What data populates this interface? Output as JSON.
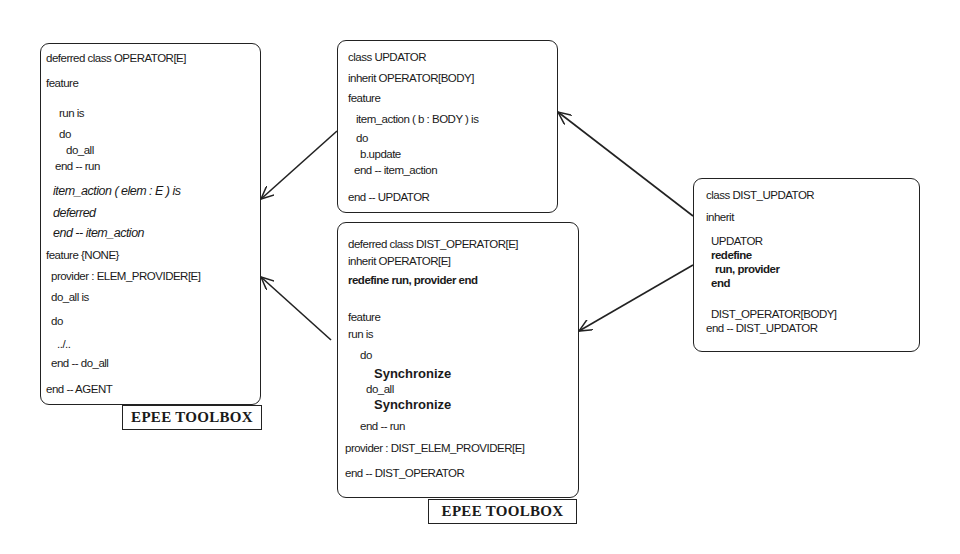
{
  "diagram": {
    "boxes": {
      "operator": {
        "lines": [
          "deferred class OPERATOR[E]",
          "feature",
          "run is",
          "do",
          "do_all",
          "end -- run",
          "item_action ( elem : E ) is",
          "deferred",
          "end -- item_action",
          "feature {NONE}",
          "provider : ELEM_PROVIDER[E]",
          "do_all is",
          "do",
          "../..",
          "end -- do_all",
          "end -- AGENT"
        ],
        "label": "EPEE TOOLBOX"
      },
      "updator": {
        "lines": [
          "class UPDATOR",
          "inherit OPERATOR[BODY]",
          "feature",
          "item_action ( b : BODY ) is",
          "do",
          "b.update",
          "end -- item_action",
          "end -- UPDATOR"
        ]
      },
      "dist_operator": {
        "lines": [
          "deferred class DIST_OPERATOR[E]",
          "inherit OPERATOR[E]",
          "redefine run, provider end",
          "feature",
          "run is",
          "do",
          "Synchronize",
          "do_all",
          "Synchronize",
          "end -- run",
          "provider : DIST_ELEM_PROVIDER[E]",
          "end -- DIST_OPERATOR"
        ],
        "label": "EPEE TOOLBOX"
      },
      "dist_updator": {
        "lines": [
          "class DIST_UPDATOR",
          "inherit",
          "UPDATOR",
          "redefine",
          "run, provider",
          "end",
          "DIST_OPERATOR[BODY]",
          "end -- DIST_UPDATOR"
        ]
      }
    },
    "edges": [
      {
        "from": "updator",
        "to": "operator",
        "type": "inherits"
      },
      {
        "from": "dist_operator",
        "to": "operator",
        "type": "inherits"
      },
      {
        "from": "dist_updator",
        "to": "updator",
        "type": "inherits"
      },
      {
        "from": "dist_updator",
        "to": "dist_operator",
        "type": "inherits"
      }
    ]
  }
}
